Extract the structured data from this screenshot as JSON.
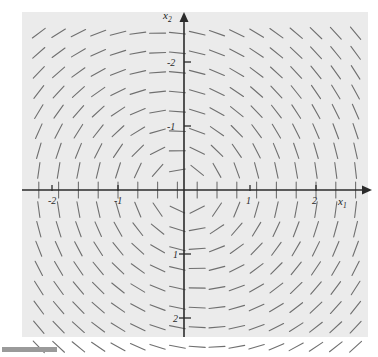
{
  "figure": {
    "background": "#ffffff",
    "plot_background": "#ebebeb",
    "axis_color": "#2b2b2b",
    "segment_color": "#6f6f6f"
  },
  "axes": {
    "x_axis_label": "x",
    "x_axis_subscript": "1",
    "y_axis_label": "x",
    "y_axis_subscript": "2",
    "x_ticks": [
      "-2",
      "-1",
      "1",
      "2"
    ],
    "y_ticks": [
      "2",
      "1",
      "-1",
      "-2"
    ]
  },
  "chart_data": {
    "type": "scatter",
    "plot_kind": "direction-field",
    "title": "",
    "xlabel": "x1",
    "ylabel": "x2",
    "xlim": [
      -2.45,
      2.8
    ],
    "ylim": [
      -2.6,
      2.65
    ],
    "xticks": [
      -2,
      -1,
      1,
      2
    ],
    "yticks": [
      -2,
      -1,
      1,
      2
    ],
    "grid": false,
    "legend": null,
    "annotations": [],
    "field": {
      "description": "Direction field of a planar linear system with a stable spiral/center-like rotation about the origin; short dash segments indicate slope direction at each grid node.",
      "u_expression": "x2",
      "v_expression": "-x1 - 0.15*x2",
      "rotation": "clockwise",
      "segment_length_px": 16,
      "grid_nx": 17,
      "grid_ny": 17,
      "grid_x_start": -2.2,
      "grid_x_end": 2.6,
      "grid_y_start": -2.45,
      "grid_y_end": 2.45
    },
    "origin_px": [
      184,
      190
    ],
    "px_per_unit_x": 66,
    "px_per_unit_y": 64
  }
}
